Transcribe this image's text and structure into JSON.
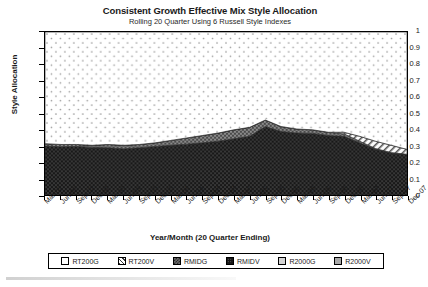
{
  "chart_data": {
    "type": "area",
    "title": "Consistent Growth Effective Mix Style Allocation",
    "subtitle": "Rolling 20 Quarter Using 6 Russell Style Indexes",
    "xlabel": "Year/Month (20 Quarter Ending)",
    "ylabel": "Style Allocation",
    "ylim": [
      0,
      1
    ],
    "yticks": [
      "0",
      "0.1",
      "0.2",
      "0.3",
      "0.4",
      "0.5",
      "0.6",
      "0.7",
      "0.8",
      "0.9",
      "1"
    ],
    "grid": true,
    "stacked": true,
    "legend_position": "bottom",
    "categories": [
      "Mar-02",
      "Jun-02",
      "Sep-02",
      "Dec-02",
      "Mar-03",
      "Jun-03",
      "Sep-03",
      "Dec-03",
      "Mar-04",
      "Jun-04",
      "Sep-04",
      "Dec-04",
      "Mar-05",
      "Jun-05",
      "Sep-05",
      "Dec-05",
      "Mar-06",
      "Jun-06",
      "Sep-06",
      "Dec-06",
      "Mar-07",
      "Jun-07",
      "Sep-07",
      "Dec-07"
    ],
    "series": [
      {
        "name": "RT200G",
        "fill": "#fdfdfd",
        "pattern": "sparse-dots",
        "values": [
          0.685,
          0.69,
          0.69,
          0.695,
          0.69,
          0.695,
          0.69,
          0.68,
          0.665,
          0.65,
          0.635,
          0.62,
          0.6,
          0.585,
          0.54,
          0.58,
          0.595,
          0.6,
          0.615,
          0.615,
          0.64,
          0.67,
          0.695,
          0.72
        ]
      },
      {
        "name": "RT200V",
        "fill": "#e8e8e8",
        "pattern": "diagonal-hatch",
        "values": [
          0,
          0,
          0,
          0,
          0,
          0,
          0,
          0,
          0,
          0,
          0,
          0,
          0,
          0,
          0,
          0,
          0,
          0,
          0,
          0.01,
          0.03,
          0.045,
          0.045,
          0.03
        ]
      },
      {
        "name": "RMIDG",
        "fill": "#8f8f8f",
        "pattern": "checker",
        "values": [
          0.015,
          0.014,
          0.012,
          0.013,
          0.02,
          0.022,
          0.02,
          0.022,
          0.03,
          0.038,
          0.045,
          0.05,
          0.055,
          0.055,
          0.04,
          0.03,
          0.025,
          0.022,
          0.02,
          0.015,
          0.01,
          0.005,
          0.002,
          0
        ]
      },
      {
        "name": "RMIDV",
        "fill": "#1c1c1c",
        "pattern": "dense-dots",
        "values": [
          0.3,
          0.296,
          0.298,
          0.292,
          0.29,
          0.283,
          0.29,
          0.298,
          0.305,
          0.312,
          0.32,
          0.33,
          0.345,
          0.36,
          0.42,
          0.39,
          0.38,
          0.378,
          0.365,
          0.36,
          0.32,
          0.28,
          0.258,
          0.25
        ]
      },
      {
        "name": "R2000G",
        "fill": "#d4d4d4",
        "pattern": "solid",
        "values": [
          0,
          0,
          0,
          0,
          0,
          0,
          0,
          0,
          0,
          0,
          0,
          0,
          0,
          0,
          0,
          0,
          0,
          0,
          0,
          0,
          0,
          0,
          0,
          0
        ]
      },
      {
        "name": "R2000V",
        "fill": "#a8a8a8",
        "pattern": "solid",
        "values": [
          0,
          0,
          0,
          0,
          0,
          0,
          0,
          0,
          0,
          0,
          0,
          0,
          0,
          0,
          0,
          0,
          0,
          0,
          0,
          0,
          0,
          0,
          0,
          0
        ]
      }
    ]
  },
  "legend": {
    "items": [
      {
        "label": "RT200G"
      },
      {
        "label": "RT200V"
      },
      {
        "label": "RMIDG"
      },
      {
        "label": "RMIDV"
      },
      {
        "label": "R2000G"
      },
      {
        "label": "R2000V"
      }
    ]
  }
}
